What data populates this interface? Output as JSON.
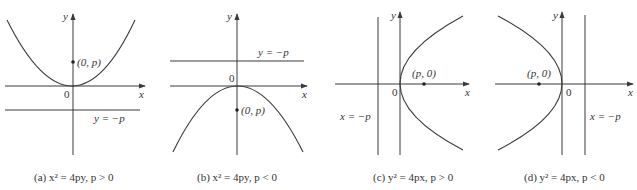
{
  "figure": {
    "panels": [
      {
        "id": "a",
        "caption": "(a) x² = 4py, p > 0",
        "caption_prefix": "(a) ",
        "equation": "x² = 4py, p > 0",
        "axis_x_label": "x",
        "axis_y_label": "y",
        "origin_label": "0",
        "focus_label": "(0, p)",
        "directrix_label": "y = −p"
      },
      {
        "id": "b",
        "caption": "(b) x² = 4py, p < 0",
        "caption_prefix": "(b) ",
        "equation": "x² = 4py, p < 0",
        "axis_x_label": "x",
        "axis_y_label": "y",
        "origin_label": "0",
        "focus_label": "(0, p)",
        "directrix_label": "y = −p"
      },
      {
        "id": "c",
        "caption": "(c) y² = 4px, p > 0",
        "caption_prefix": "(c) ",
        "equation": "y² = 4px, p > 0",
        "axis_x_label": "x",
        "axis_y_label": "y",
        "origin_label": "0",
        "focus_label": "(p, 0)",
        "directrix_label": "x = −p"
      },
      {
        "id": "d",
        "caption": "(d) y² = 4px, p < 0",
        "caption_prefix": "(d) ",
        "equation": "y² = 4px, p < 0",
        "axis_x_label": "x",
        "axis_y_label": "y",
        "origin_label": "0",
        "focus_label": "(p, 0)",
        "directrix_label": "x = −p"
      }
    ],
    "colors": {
      "ink": "#3a3a3a",
      "background": "#ffffff"
    }
  }
}
